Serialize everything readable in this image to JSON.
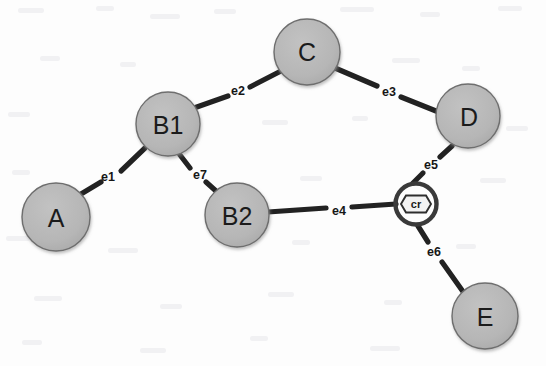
{
  "diagram": {
    "canvas": {
      "width": 546,
      "height": 366
    },
    "colors": {
      "background": "#fdfdfd",
      "node_fill": "#b4b4b4",
      "node_stroke": "#6e6e6e",
      "edge_stroke": "#222222",
      "cr_ring": "#3a3a3a",
      "cr_fill": "#f2f2f2",
      "label_text": "#161616"
    },
    "nodes": [
      {
        "id": "A",
        "label": "A",
        "shape": "circle",
        "cx": 56,
        "cy": 217,
        "r": 34,
        "font": "big"
      },
      {
        "id": "B1",
        "label": "B1",
        "shape": "circle",
        "cx": 168,
        "cy": 124,
        "r": 32,
        "font": "big"
      },
      {
        "id": "C",
        "label": "C",
        "shape": "circle",
        "cx": 307,
        "cy": 52,
        "r": 33,
        "font": "big"
      },
      {
        "id": "D",
        "label": "D",
        "shape": "circle",
        "cx": 468,
        "cy": 116,
        "r": 32,
        "font": "big"
      },
      {
        "id": "B2",
        "label": "B2",
        "shape": "circle",
        "cx": 237,
        "cy": 215,
        "r": 32,
        "font": "big"
      },
      {
        "id": "E",
        "label": "E",
        "shape": "circle",
        "cx": 485,
        "cy": 316,
        "r": 33,
        "font": "big"
      },
      {
        "id": "cr",
        "label": "cr",
        "shape": "hexagon-in-ring",
        "cx": 416,
        "cy": 204,
        "r": 23,
        "font": "cr"
      }
    ],
    "edges": [
      {
        "id": "e1",
        "label": "e1",
        "from": "A",
        "to": "B1",
        "label_x": 108,
        "label_y": 177
      },
      {
        "id": "e2",
        "label": "e2",
        "from": "B1",
        "to": "C",
        "label_x": 238,
        "label_y": 91
      },
      {
        "id": "e3",
        "label": "e3",
        "from": "C",
        "to": "D",
        "label_x": 389,
        "label_y": 92
      },
      {
        "id": "e4",
        "label": "e4",
        "from": "B2",
        "to": "cr",
        "label_x": 339,
        "label_y": 211
      },
      {
        "id": "e5",
        "label": "e5",
        "from": "cr",
        "to": "D",
        "label_x": 431,
        "label_y": 165
      },
      {
        "id": "e6",
        "label": "e6",
        "from": "cr",
        "to": "E",
        "label_x": 434,
        "label_y": 252
      },
      {
        "id": "e7",
        "label": "e7",
        "from": "B1",
        "to": "B2",
        "label_x": 200,
        "label_y": 175
      }
    ]
  }
}
